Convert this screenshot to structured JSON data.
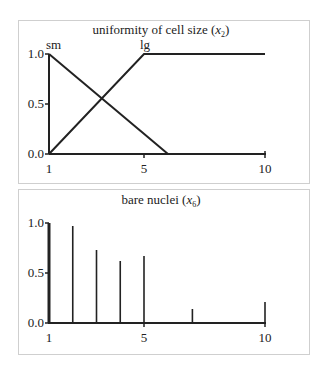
{
  "chart_data": [
    {
      "type": "line",
      "title": "uniformity of cell size (x2)",
      "title_main": "uniformity of cell size (",
      "title_var": "x",
      "title_sub": "2",
      "title_end": ")",
      "xlabel": "",
      "ylabel": "",
      "xlim": [
        1,
        10
      ],
      "ylim": [
        0,
        1
      ],
      "xticks": [
        "1",
        "5",
        "10"
      ],
      "yticks": [
        "0.0",
        "0.5",
        "1.0"
      ],
      "grid": false,
      "legend": "inline labels",
      "series": [
        {
          "name": "sm",
          "x": [
            1,
            6
          ],
          "y": [
            1.0,
            0.0
          ]
        },
        {
          "name": "lg",
          "x": [
            1,
            5,
            10
          ],
          "y": [
            0.0,
            1.0,
            1.0
          ]
        }
      ],
      "labels": {
        "sm": "sm",
        "lg": "lg"
      }
    },
    {
      "type": "bar",
      "title": "bare nuclei (x6)",
      "title_main": "bare nuclei (",
      "title_var": "x",
      "title_sub": "6",
      "title_end": ")",
      "xlabel": "",
      "ylabel": "",
      "xlim": [
        1,
        10
      ],
      "ylim": [
        0,
        1
      ],
      "xticks": [
        "1",
        "5",
        "10"
      ],
      "yticks": [
        "0.0",
        "0.5",
        "1.0"
      ],
      "grid": false,
      "categories": [
        1,
        2,
        3,
        4,
        5,
        7,
        10
      ],
      "values": [
        1.0,
        0.97,
        0.73,
        0.62,
        0.67,
        0.14,
        0.21
      ]
    }
  ]
}
